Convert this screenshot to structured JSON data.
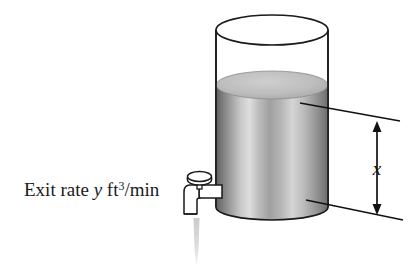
{
  "figure": {
    "background_color": "#ffffff",
    "ink_color": "#1a1a1a"
  },
  "labels": {
    "exit_rate": {
      "prefix": "Exit rate ",
      "variable": "y",
      "unit_base": " ft",
      "unit_exponent": "3",
      "unit_rest": "/min",
      "full_text": "Exit rate y ft3/min"
    },
    "dimension": {
      "text": "x",
      "meaning": "liquid-height"
    }
  },
  "tank": {
    "name": "cylindrical-tank",
    "outline_color": "#1a1a1a",
    "liquid_top_color": "#b4b4b4",
    "liquid_body_dark": "#6e6e6e",
    "liquid_body_light": "#e2e2e2",
    "empty_top_color": "#ffffff",
    "left_x": 216,
    "right_x": 328,
    "rim_y": 30,
    "liquid_surface_y": 85,
    "bottom_y": 207
  },
  "faucet": {
    "name": "spigot",
    "body_color": "#ffffff",
    "outline_color": "#1a1a1a",
    "knob_label": "valve-knob",
    "stream_color": "#d9d9d9"
  },
  "dimension_arrow": {
    "name": "height-dimension",
    "top_y": 121,
    "bottom_y": 213,
    "x_position": 377,
    "double_headed": true,
    "color": "#111111"
  }
}
